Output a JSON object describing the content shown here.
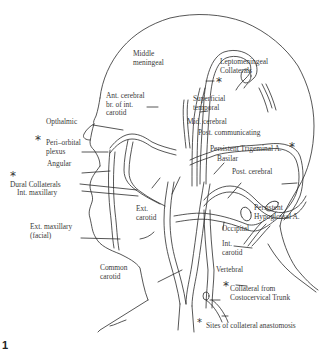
{
  "figure": {
    "corner_mark": "1",
    "legend": {
      "marker": "*",
      "text": "Sites of collateral anastomosis"
    },
    "labels": {
      "middle_meningeal": [
        "Middle",
        "meningeal"
      ],
      "leptomeningeal": [
        "Leptomeningeal",
        "Collaterals"
      ],
      "ant_cerebral": [
        "Ant. cerebral",
        "br. of int.",
        "carotid"
      ],
      "superficial_temporal": [
        "Superficial",
        "temporal"
      ],
      "mid_cerebral": "Mid. cerebral",
      "post_communicating": "Post. communicating",
      "opthalmic": "Opthalmic",
      "peri_orbital": [
        "Peri–orbital",
        "plexus"
      ],
      "angular": "Angular",
      "persistent_trigeminal": "Persistent Trigeminal A.",
      "basilar": "Basilar",
      "post_cerebral": "Post. cerebral",
      "dural_collaterals": "Dural Collaterals",
      "int_maxillary": "Int. maxillary",
      "ext_carotid": [
        "Ext.",
        "carotid"
      ],
      "persistent_hypoglossal": [
        "Persistent",
        "Hypoglossal A."
      ],
      "ext_maxillary": [
        "Ext. maxillary",
        "(facial)"
      ],
      "occipital": "Occipital",
      "int_carotid": [
        "Int.",
        "carotid"
      ],
      "common_carotid": [
        "Common",
        "carotid"
      ],
      "vertebral": "Vertebral",
      "collateral_costocervical": [
        "Collateral from",
        "Costocervical Trunk"
      ]
    },
    "collateral_markers": [
      "leptomeningeal",
      "peri_orbital",
      "dural_collaterals",
      "persistent_trigeminal",
      "collateral_costocervical"
    ]
  }
}
